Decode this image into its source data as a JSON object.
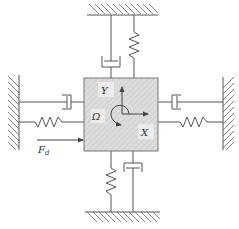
{
  "diagram": {
    "type": "mass-spring-damper schematic",
    "labels": {
      "y_axis": "Y",
      "x_axis": "X",
      "rotation": "Ω",
      "force_main": "F",
      "force_sub": "d"
    },
    "colors": {
      "line": "#555555",
      "hatch": "#666666",
      "mass_fill": "#dcdcdc",
      "mass_pattern": "#c4c4c4",
      "text": "#333333",
      "background": "#ffffff"
    },
    "components": {
      "walls": [
        "top-wall",
        "bottom-wall",
        "left-wall",
        "right-wall"
      ],
      "top": [
        "damper",
        "spring"
      ],
      "bottom": [
        "spring",
        "damper"
      ],
      "left": [
        "damper",
        "spring"
      ],
      "right": [
        "damper",
        "spring"
      ]
    }
  }
}
